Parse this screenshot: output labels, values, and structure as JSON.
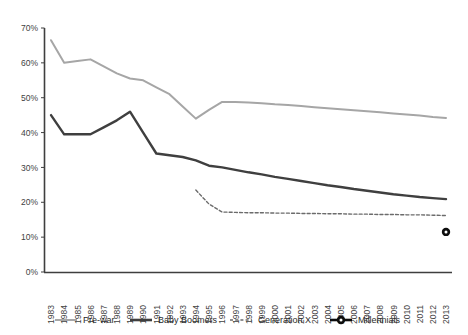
{
  "chart_data": {
    "type": "line",
    "title": "",
    "subtitle": "",
    "xlabel": "",
    "ylabel": "",
    "grid": false,
    "legend_position": "bottom",
    "ylim": [
      0,
      70
    ],
    "ytick_labels": [
      "0%",
      "10%",
      "20%",
      "30%",
      "40%",
      "50%",
      "60%",
      "70%"
    ],
    "ytick_values": [
      0,
      10,
      20,
      30,
      40,
      50,
      60,
      70
    ],
    "x": [
      1983,
      1984,
      1985,
      1986,
      1987,
      1988,
      1989,
      1990,
      1991,
      1992,
      1993,
      1994,
      1995,
      1996,
      1997,
      1998,
      1999,
      2000,
      2001,
      2002,
      2003,
      2004,
      2005,
      2006,
      2007,
      2008,
      2009,
      2010,
      2011,
      2012,
      2013
    ],
    "xtick_labels": [
      "1983",
      "1984",
      "1985",
      "1986",
      "1987",
      "1988",
      "1989",
      "1990",
      "1991",
      "1992",
      "1993",
      "1994",
      "1995",
      "1996",
      "1997",
      "1998",
      "1999",
      "2000",
      "2001",
      "2002",
      "2003",
      "2004",
      "2005",
      "2006",
      "2007",
      "2008",
      "2009",
      "2010",
      "2011",
      "2012",
      "2013"
    ],
    "series": [
      {
        "name": "Pre-war",
        "color": "#a6a6a6",
        "style": "solid",
        "width": 2,
        "marker": "none",
        "values": [
          66.5,
          60.0,
          60.5,
          61.0,
          59.0,
          57.0,
          55.5,
          55.0,
          53.0,
          51.0,
          47.5,
          44.0,
          46.5,
          48.8,
          48.8,
          48.6,
          48.4,
          48.1,
          47.9,
          47.6,
          47.3,
          47.0,
          46.7,
          46.4,
          46.1,
          45.8,
          45.5,
          45.2,
          44.9,
          44.5,
          44.2
        ]
      },
      {
        "name": "Baby Boomers",
        "color": "#3f3f3f",
        "style": "solid",
        "width": 2.4,
        "marker": "none",
        "values": [
          45.0,
          39.5,
          39.5,
          39.5,
          41.5,
          43.5,
          46.0,
          40.0,
          34.0,
          33.5,
          33.0,
          32.0,
          30.5,
          30.0,
          29.3,
          28.6,
          28.0,
          27.3,
          26.7,
          26.1,
          25.5,
          24.9,
          24.4,
          23.8,
          23.3,
          22.8,
          22.3,
          21.9,
          21.5,
          21.2,
          20.9
        ]
      },
      {
        "name": "Generation X",
        "color": "#6b6b6b",
        "style": "dashed",
        "width": 1.4,
        "marker": "none",
        "start_index": 11,
        "values": [
          null,
          null,
          null,
          null,
          null,
          null,
          null,
          null,
          null,
          null,
          null,
          23.5,
          19.5,
          17.2,
          17.1,
          17.0,
          17.0,
          16.9,
          16.9,
          16.8,
          16.8,
          16.7,
          16.7,
          16.6,
          16.6,
          16.5,
          16.5,
          16.4,
          16.4,
          16.3,
          16.2
        ]
      },
      {
        "name": "Millennials",
        "color": "#0d0d0d",
        "style": "solid",
        "width": 2.4,
        "marker": "circle",
        "values": [
          null,
          null,
          null,
          null,
          null,
          null,
          null,
          null,
          null,
          null,
          null,
          null,
          null,
          null,
          null,
          null,
          null,
          null,
          null,
          null,
          null,
          null,
          null,
          null,
          null,
          null,
          null,
          null,
          null,
          null,
          11.5
        ]
      }
    ],
    "legend": [
      {
        "label": "Pre-war",
        "color": "#a6a6a6",
        "style": "solid",
        "marker": "none"
      },
      {
        "label": "Baby Boomers",
        "color": "#3f3f3f",
        "style": "solid",
        "marker": "none"
      },
      {
        "label": "Generation X",
        "color": "#6b6b6b",
        "style": "dashed",
        "marker": "none"
      },
      {
        "label": "Millennials",
        "color": "#0d0d0d",
        "style": "solid",
        "marker": "circle"
      }
    ]
  }
}
